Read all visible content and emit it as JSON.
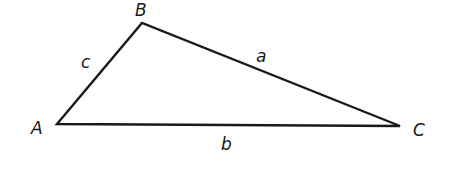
{
  "diagram": {
    "type": "triangle",
    "vertices": [
      {
        "label": "A",
        "x": 57,
        "y": 124
      },
      {
        "label": "B",
        "x": 142,
        "y": 23
      },
      {
        "label": "C",
        "x": 400,
        "y": 126
      }
    ],
    "sides": [
      {
        "label": "a",
        "from": "B",
        "to": "C"
      },
      {
        "label": "b",
        "from": "A",
        "to": "C"
      },
      {
        "label": "c",
        "from": "A",
        "to": "B"
      }
    ],
    "labels": {
      "A": "A",
      "B": "B",
      "C": "C",
      "a": "a",
      "b": "b",
      "c": "c"
    },
    "stroke_color": "#1a1a1a"
  }
}
